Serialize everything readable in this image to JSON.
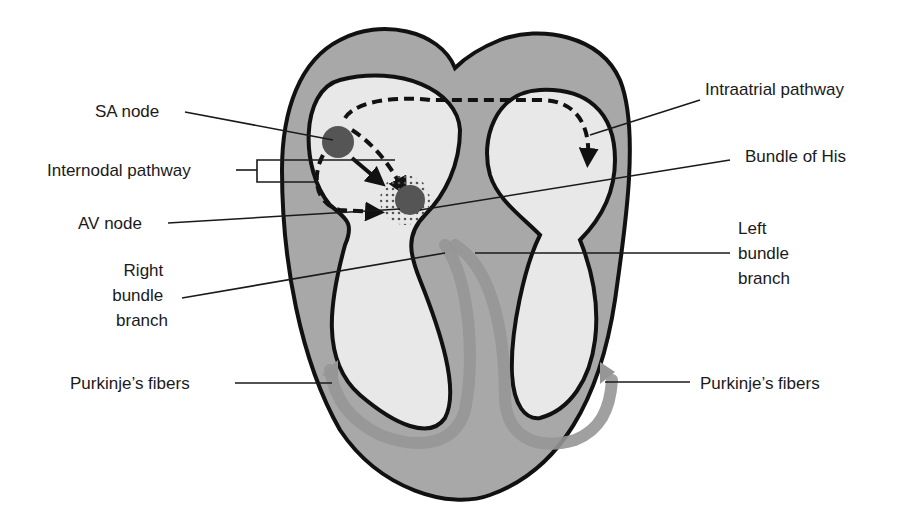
{
  "diagram": {
    "colors": {
      "myocardium": "#a8a8a8",
      "chamber": "#e8e8e8",
      "outline": "#111111",
      "node": "#555555",
      "conduction_band": "#969696"
    },
    "labels": {
      "sa_node": "SA node",
      "internodal_pathway": "Internodal pathway",
      "av_node": "AV node",
      "right_bundle_branch": [
        "Right",
        "bundle",
        "branch"
      ],
      "purkinje_left": "Purkinje’s fibers",
      "intraatrial_pathway": "Intraatrial pathway",
      "bundle_of_his": "Bundle of His",
      "left_bundle_branch": [
        "Left",
        "bundle",
        "branch"
      ],
      "purkinje_right": "Purkinje’s fibers"
    }
  }
}
